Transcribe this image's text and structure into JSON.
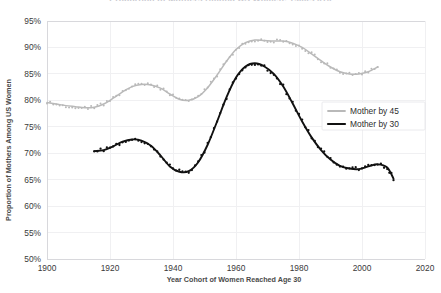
{
  "chart_data": {
    "type": "line",
    "title": "Proportion of Mothers Among US Women, 1900-2010",
    "xlabel": "Year Cohort of Women Reached Age 30",
    "ylabel": "Proportion of Mothers Among US Women",
    "xlim": [
      1900,
      2020
    ],
    "ylim": [
      50,
      95
    ],
    "xticks": [
      "1900",
      "1920",
      "1940",
      "1960",
      "1980",
      "2000",
      "2020"
    ],
    "xtick_values": [
      1900,
      1920,
      1940,
      1960,
      1980,
      2000,
      2020
    ],
    "yticks": [
      "50%",
      "55%",
      "60%",
      "65%",
      "70%",
      "75%",
      "80%",
      "85%",
      "90%",
      "95%"
    ],
    "ytick_values": [
      50,
      55,
      60,
      65,
      70,
      75,
      80,
      85,
      90,
      95
    ],
    "grid": true,
    "legend_position": "center-right",
    "series": [
      {
        "name": "Mother by 45",
        "color": "#b9b9b9",
        "marker": "dot",
        "x": [
          1900,
          1903,
          1906,
          1909,
          1912,
          1915,
          1918,
          1921,
          1924,
          1927,
          1930,
          1933,
          1936,
          1939,
          1942,
          1945,
          1948,
          1951,
          1954,
          1957,
          1960,
          1963,
          1966,
          1969,
          1972,
          1975,
          1978,
          1981,
          1984,
          1987,
          1990,
          1993,
          1996,
          1999,
          2002,
          2005
        ],
        "values": [
          79.6,
          79.3,
          79.0,
          78.8,
          78.6,
          78.7,
          79.3,
          80.4,
          81.6,
          82.6,
          83.0,
          82.9,
          82.3,
          81.2,
          80.2,
          80.0,
          80.7,
          82.4,
          84.8,
          87.4,
          89.6,
          90.9,
          91.4,
          91.3,
          91.2,
          91.2,
          90.8,
          90.0,
          88.8,
          87.5,
          86.3,
          85.4,
          85.0,
          85.0,
          85.4,
          86.3
        ]
      },
      {
        "name": "Mother by 30",
        "color": "#111111",
        "marker": "dot",
        "x": [
          1915,
          1918,
          1921,
          1924,
          1927,
          1930,
          1933,
          1936,
          1939,
          1942,
          1945,
          1948,
          1951,
          1954,
          1957,
          1960,
          1963,
          1966,
          1969,
          1972,
          1975,
          1978,
          1981,
          1984,
          1987,
          1990,
          1993,
          1996,
          1999,
          2002,
          2005,
          2008,
          2010
        ],
        "values": [
          70.4,
          70.6,
          71.3,
          72.2,
          72.6,
          72.4,
          71.4,
          69.6,
          67.5,
          66.5,
          66.6,
          68.3,
          71.6,
          76.0,
          80.6,
          84.3,
          86.4,
          87.0,
          86.4,
          85.0,
          82.6,
          79.4,
          76.0,
          73.0,
          70.6,
          68.8,
          67.6,
          67.1,
          67.0,
          67.5,
          67.9,
          67.3,
          65.2
        ]
      }
    ]
  },
  "legend": {
    "items": [
      {
        "label": "Mother by 45",
        "color": "#b9b9b9"
      },
      {
        "label": "Mother by 30",
        "color": "#111111"
      }
    ]
  }
}
